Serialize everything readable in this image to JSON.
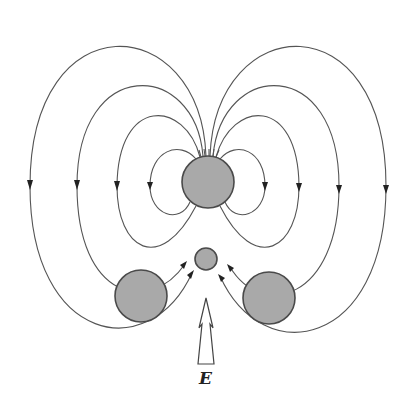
{
  "diagram": {
    "title": "",
    "labels": {
      "field_arrow": "E"
    },
    "colors": {
      "background": "#ffffff",
      "sphere_fill": "#a9a9a9",
      "sphere_stroke": "#4a4a4a",
      "field_line": "#555555",
      "arrowhead": "#222222"
    },
    "spheres": [
      {
        "id": "central-large",
        "cx": 208,
        "cy": 182,
        "r": 26
      },
      {
        "id": "center-small",
        "cx": 206,
        "cy": 259,
        "r": 11
      },
      {
        "id": "bottom-left",
        "cx": 141,
        "cy": 296,
        "r": 26
      },
      {
        "id": "bottom-right",
        "cx": 269,
        "cy": 298,
        "r": 26
      }
    ],
    "field_arrow": {
      "x": 206,
      "y_top": 298,
      "y_bottom": 364,
      "direction": "up"
    }
  }
}
